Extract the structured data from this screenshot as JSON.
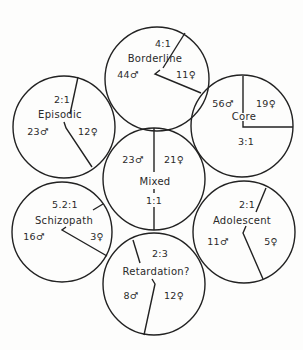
{
  "diagram": {
    "type": "circle-cluster",
    "circles": [
      {
        "name": "Borderline",
        "male": "44♂",
        "female": "11♀",
        "ratio": "4:1",
        "male_count": 44,
        "female_count": 11
      },
      {
        "name": "Episodic",
        "male": "23♂",
        "female": "12♀",
        "ratio": "2:1",
        "male_count": 23,
        "female_count": 12
      },
      {
        "name": "Core",
        "male": "56♂",
        "female": "19♀",
        "ratio": "3:1",
        "male_count": 56,
        "female_count": 19
      },
      {
        "name": "Mixed",
        "male": "23♂",
        "female": "21♀",
        "ratio": "1:1",
        "male_count": 23,
        "female_count": 21
      },
      {
        "name": "Schizopath",
        "male": "16♂",
        "female": "3♀",
        "ratio": "5.2:1",
        "male_count": 16,
        "female_count": 3
      },
      {
        "name": "Adolescent",
        "male": "11♂",
        "female": "5♀",
        "ratio": "2:1",
        "male_count": 11,
        "female_count": 5
      },
      {
        "name": "Retardation?",
        "male": "8♂",
        "female": "12♀",
        "ratio": "2:3",
        "male_count": 8,
        "female_count": 12
      }
    ],
    "colors": {
      "stroke": "#222222",
      "background": "#fdfdfc",
      "text": "#2a2a2a"
    }
  }
}
